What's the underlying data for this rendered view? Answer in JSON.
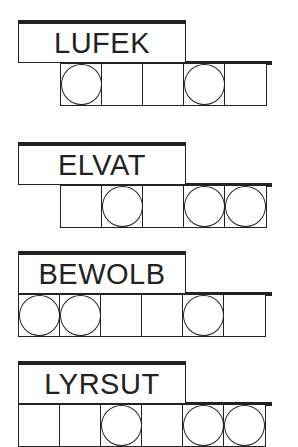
{
  "puzzles": [
    {
      "scrambled": "LUFEK",
      "letters": 5,
      "circled": [
        1,
        4
      ]
    },
    {
      "scrambled": "ELVAT",
      "letters": 5,
      "circled": [
        2,
        4,
        5
      ]
    },
    {
      "scrambled": "BEWOLB",
      "letters": 6,
      "circled": [
        1,
        2,
        5
      ]
    },
    {
      "scrambled": "LYRSUT",
      "letters": 6,
      "circled": [
        3,
        5,
        6
      ]
    }
  ],
  "colors": {
    "line": "#222222",
    "background": "#ffffff"
  }
}
